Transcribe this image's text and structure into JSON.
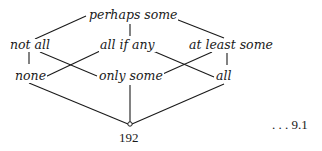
{
  "diagram": {
    "type": "lattice",
    "nodes": {
      "top": "perhaps some",
      "mid_left": "not all",
      "mid_center": "all if any",
      "mid_right": "at least some",
      "low_left": "none",
      "low_center": "only some",
      "low_right": "all"
    },
    "bottom_vertex_label": "192",
    "equation_number": ". . . 9.1",
    "edges": [
      [
        "perhaps some",
        "not all"
      ],
      [
        "perhaps some",
        "all if any"
      ],
      [
        "perhaps some",
        "at least some"
      ],
      [
        "not all",
        "none"
      ],
      [
        "not all",
        "only some"
      ],
      [
        "all if any",
        "none"
      ],
      [
        "all if any",
        "all"
      ],
      [
        "at least some",
        "only some"
      ],
      [
        "at least some",
        "all"
      ],
      [
        "none",
        "192"
      ],
      [
        "only some",
        "192"
      ],
      [
        "all",
        "192"
      ]
    ],
    "colors": {
      "ink": "#1a1a1a",
      "background": "#ffffff"
    }
  }
}
